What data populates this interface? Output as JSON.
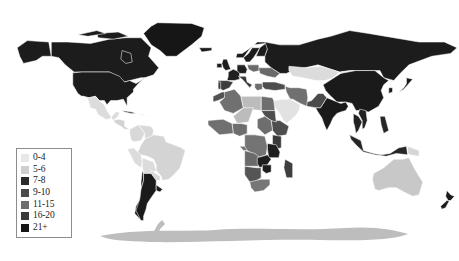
{
  "figure": {
    "kind": "world-choropleth-map",
    "projection": "equirectangular",
    "background_color": "#ffffff",
    "ocean_color": "#ffffff",
    "border_color": "#ffffff",
    "no_data_color": "#ffffff",
    "width": 459,
    "height": 261
  },
  "legend": {
    "name": "map-legend",
    "border_color": "#8d8d8d",
    "background_color": "#ffffff",
    "entries": [
      {
        "label": "0-4",
        "color": "#e8e8e8"
      },
      {
        "label": "5-6",
        "color": "#cfcfcf"
      },
      {
        "label": "7-8",
        "color": "#2b2b2b"
      },
      {
        "label": "9-10",
        "color": "#4a4a4a"
      },
      {
        "label": "11-15",
        "color": "#6e6e6e"
      },
      {
        "label": "16-20",
        "color": "#3a3a3a"
      },
      {
        "label": "21+",
        "color": "#161616"
      }
    ]
  },
  "chart_data": {
    "type": "map",
    "title": "",
    "classes": [
      "0-4",
      "5-6",
      "7-8",
      "9-10",
      "11-15",
      "16-20",
      "21+"
    ],
    "class_colors": [
      "#e8e8e8",
      "#cfcfcf",
      "#2b2b2b",
      "#4a4a4a",
      "#6e6e6e",
      "#3a3a3a",
      "#161616"
    ],
    "regions": [
      {
        "name": "Greenland",
        "class": "21+",
        "color": "#161616"
      },
      {
        "name": "Canada",
        "class": "21+",
        "color": "#1c1c1c"
      },
      {
        "name": "United States",
        "class": "21+",
        "color": "#1c1c1c"
      },
      {
        "name": "Alaska",
        "class": "21+",
        "color": "#1c1c1c"
      },
      {
        "name": "Mexico",
        "class": "0-4",
        "color": "#dcdcdc"
      },
      {
        "name": "Central America",
        "class": "0-4",
        "color": "#d2d2d2"
      },
      {
        "name": "Caribbean",
        "class": "5-6",
        "color": "#c4c4c4"
      },
      {
        "name": "Cuba",
        "class": "16-20",
        "color": "#3a3a3a"
      },
      {
        "name": "Colombia",
        "class": "0-4",
        "color": "#d8d8d8"
      },
      {
        "name": "Venezuela",
        "class": "0-4",
        "color": "#d8d8d8"
      },
      {
        "name": "Brazil",
        "class": "0-4",
        "color": "#d4d4d4"
      },
      {
        "name": "Peru",
        "class": "0-4",
        "color": "#dcdcdc"
      },
      {
        "name": "Bolivia",
        "class": "0-4",
        "color": "#dcdcdc"
      },
      {
        "name": "Chile",
        "class": "21+",
        "color": "#1a1a1a"
      },
      {
        "name": "Argentina",
        "class": "21+",
        "color": "#1a1a1a"
      },
      {
        "name": "Uruguay",
        "class": "21+",
        "color": "#1a1a1a"
      },
      {
        "name": "Paraguay",
        "class": "0-4",
        "color": "#d8d8d8"
      },
      {
        "name": "United Kingdom",
        "class": "21+",
        "color": "#1c1c1c"
      },
      {
        "name": "Ireland",
        "class": "21+",
        "color": "#1c1c1c"
      },
      {
        "name": "Iceland",
        "class": "21+",
        "color": "#1c1c1c"
      },
      {
        "name": "Norway",
        "class": "21+",
        "color": "#1c1c1c"
      },
      {
        "name": "Sweden",
        "class": "21+",
        "color": "#1c1c1c"
      },
      {
        "name": "Finland",
        "class": "21+",
        "color": "#1c1c1c"
      },
      {
        "name": "France",
        "class": "21+",
        "color": "#202020"
      },
      {
        "name": "Spain",
        "class": "16-20",
        "color": "#3c3c3c"
      },
      {
        "name": "Portugal",
        "class": "16-20",
        "color": "#3c3c3c"
      },
      {
        "name": "Germany",
        "class": "21+",
        "color": "#202020"
      },
      {
        "name": "Poland",
        "class": "11-15",
        "color": "#6a6a6a"
      },
      {
        "name": "Italy",
        "class": "16-20",
        "color": "#3a3a3a"
      },
      {
        "name": "Greece",
        "class": "11-15",
        "color": "#6e6e6e"
      },
      {
        "name": "Turkey",
        "class": "9-10",
        "color": "#4e4e4e"
      },
      {
        "name": "Ukraine",
        "class": "11-15",
        "color": "#6a6a6a"
      },
      {
        "name": "Russia",
        "class": "21+",
        "color": "#1c1c1c"
      },
      {
        "name": "Kazakhstan",
        "class": "0-4",
        "color": "#dcdcdc"
      },
      {
        "name": "China",
        "class": "21+",
        "color": "#1a1a1a"
      },
      {
        "name": "Mongolia",
        "class": "0-4",
        "color": "#d8d8d8"
      },
      {
        "name": "Japan",
        "class": "21+",
        "color": "#1a1a1a"
      },
      {
        "name": "South Korea",
        "class": "21+",
        "color": "#1a1a1a"
      },
      {
        "name": "India",
        "class": "21+",
        "color": "#1a1a1a"
      },
      {
        "name": "Pakistan",
        "class": "9-10",
        "color": "#4a4a4a"
      },
      {
        "name": "Iran",
        "class": "11-15",
        "color": "#707070"
      },
      {
        "name": "Saudi Arabia",
        "class": "0-4",
        "color": "#e2e2e2"
      },
      {
        "name": "Indonesia",
        "class": "21+",
        "color": "#262626"
      },
      {
        "name": "Philippines",
        "class": "21+",
        "color": "#262626"
      },
      {
        "name": "Thailand",
        "class": "21+",
        "color": "#222222"
      },
      {
        "name": "Vietnam",
        "class": "21+",
        "color": "#222222"
      },
      {
        "name": "Egypt",
        "class": "11-15",
        "color": "#6e6e6e"
      },
      {
        "name": "Libya",
        "class": "5-6",
        "color": "#bcbcbc"
      },
      {
        "name": "Algeria",
        "class": "11-15",
        "color": "#707070"
      },
      {
        "name": "Morocco",
        "class": "9-10",
        "color": "#525252"
      },
      {
        "name": "Nigeria",
        "class": "11-15",
        "color": "#6e6e6e"
      },
      {
        "name": "Ethiopia",
        "class": "9-10",
        "color": "#4e4e4e"
      },
      {
        "name": "Kenya",
        "class": "16-20",
        "color": "#3a3a3a"
      },
      {
        "name": "Tanzania",
        "class": "21+",
        "color": "#1e1e1e"
      },
      {
        "name": "D.R. Congo",
        "class": "11-15",
        "color": "#747474"
      },
      {
        "name": "Angola",
        "class": "11-15",
        "color": "#6a6a6a"
      },
      {
        "name": "Zambia",
        "class": "21+",
        "color": "#1e1e1e"
      },
      {
        "name": "Zimbabwe",
        "class": "21+",
        "color": "#1e1e1e"
      },
      {
        "name": "South Africa",
        "class": "11-15",
        "color": "#767676"
      },
      {
        "name": "Namibia",
        "class": "9-10",
        "color": "#555555"
      },
      {
        "name": "Madagascar",
        "class": "16-20",
        "color": "#3e3e3e"
      },
      {
        "name": "Australia",
        "class": "5-6",
        "color": "#c8c8c8"
      },
      {
        "name": "New Zealand",
        "class": "21+",
        "color": "#1a1a1a"
      },
      {
        "name": "Papua New Guinea",
        "class": "0-4",
        "color": "#d6d6d6"
      },
      {
        "name": "Antarctica",
        "class": "5-6",
        "color": "#bdbdbd"
      }
    ]
  }
}
